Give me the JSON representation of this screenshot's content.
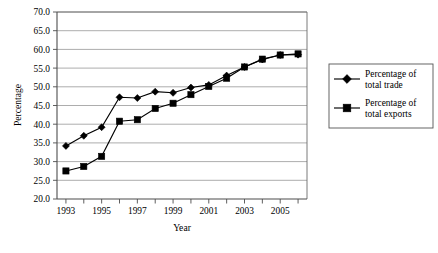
{
  "chart_data": {
    "type": "line",
    "title": "",
    "xlabel": "Year",
    "ylabel": "Percentage",
    "x": [
      1993,
      1994,
      1995,
      1996,
      1997,
      1998,
      1999,
      2000,
      2001,
      2002,
      2003,
      2004,
      2005,
      2006
    ],
    "xtick_labels": [
      "1993",
      "",
      "1995",
      "",
      "1997",
      "",
      "1999",
      "",
      "2001",
      "",
      "2003",
      "",
      "2005",
      ""
    ],
    "xlim": [
      1992.5,
      2006.5
    ],
    "ylim": [
      20.0,
      70.0
    ],
    "ytick_labels": [
      "20.0",
      "25.0",
      "30.0",
      "35.0",
      "40.0",
      "45.0",
      "50.0",
      "55.0",
      "60.0",
      "65.0",
      "70.0"
    ],
    "ytick_values": [
      20.0,
      25.0,
      30.0,
      35.0,
      40.0,
      45.0,
      50.0,
      55.0,
      60.0,
      65.0,
      70.0
    ],
    "grid": "horizontal",
    "legend_position": "right",
    "series": [
      {
        "name": "Percentage of total trade",
        "marker": "diamond",
        "color": "#000000",
        "values": [
          34.2,
          36.9,
          39.2,
          47.2,
          47.0,
          48.7,
          48.4,
          49.8,
          50.5,
          53.0,
          55.3,
          57.3,
          58.5,
          58.6
        ]
      },
      {
        "name": "Percentage of total exports",
        "marker": "square",
        "color": "#000000",
        "values": [
          27.5,
          28.7,
          31.4,
          40.8,
          41.2,
          44.2,
          45.6,
          47.9,
          50.1,
          52.3,
          55.3,
          57.4,
          58.5,
          58.8
        ]
      }
    ]
  },
  "legend": {
    "entries": [
      {
        "label_line1": "Percentage of",
        "label_line2": "total trade",
        "marker": "diamond"
      },
      {
        "label_line1": "Percentage of",
        "label_line2": "total exports",
        "marker": "square"
      }
    ]
  }
}
